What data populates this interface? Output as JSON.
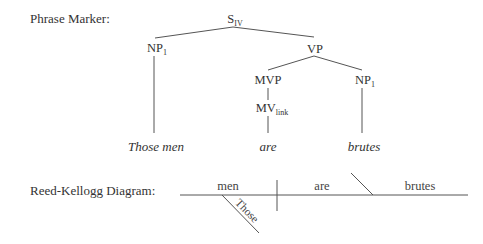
{
  "phrase_marker": {
    "label": "Phrase Marker:",
    "nodes": {
      "root": {
        "base": "S",
        "sub": "IV"
      },
      "np_subject": {
        "base": "NP",
        "sub": "1"
      },
      "vp": {
        "base": "VP",
        "sub": ""
      },
      "mvp": {
        "base": "MVP",
        "sub": ""
      },
      "mv": {
        "base": "MV",
        "sub": "link"
      },
      "np_complement": {
        "base": "NP",
        "sub": "1"
      }
    },
    "words": {
      "subject": "Those men",
      "verb": "are",
      "complement": "brutes"
    }
  },
  "reed_kellogg": {
    "label": "Reed-Kellogg Diagram:",
    "subject": "men",
    "verb": "are",
    "complement": "brutes",
    "modifier": "Those"
  }
}
